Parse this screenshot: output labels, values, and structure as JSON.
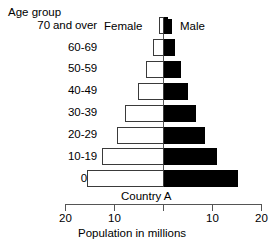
{
  "chart_data": {
    "type": "bar",
    "subtype": "population-pyramid",
    "title": "Country A",
    "xlabel": "Population in millions",
    "ylabel": "Age group",
    "categories": [
      "70 and over",
      "60-69",
      "50-59",
      "40-49",
      "30-39",
      "20-29",
      "10-19",
      "0-9"
    ],
    "series": [
      {
        "name": "Female",
        "side": "left",
        "color": "#ffffff",
        "values": [
          1.0,
          2.2,
          3.6,
          5.2,
          7.9,
          9.4,
          12.6,
          15.7
        ]
      },
      {
        "name": "Male",
        "side": "right",
        "color": "#000000",
        "values": [
          1.0,
          2.4,
          3.5,
          5.0,
          6.7,
          8.4,
          11.0,
          15.3
        ]
      }
    ],
    "xticks": [
      20,
      10,
      0,
      10,
      20
    ],
    "xtick_labels": [
      "20",
      "10",
      "",
      "10",
      "20"
    ],
    "xlim": [
      20,
      20
    ],
    "grid": false,
    "legend_position": "top-center",
    "annotations": []
  },
  "axes": {
    "age_axis_title": "Age group",
    "population_axis_title": "Population in millions",
    "age_groups": [
      {
        "label": "70 and over"
      },
      {
        "label": "60-69"
      },
      {
        "label": "50-59"
      },
      {
        "label": "40-49"
      },
      {
        "label": "30-39"
      },
      {
        "label": "20-29"
      },
      {
        "label": "10-19"
      },
      {
        "label": "0-9"
      }
    ],
    "population_ticks": [
      {
        "label": "20"
      },
      {
        "label": "10"
      },
      {
        "label": ""
      },
      {
        "label": "10"
      },
      {
        "label": "20"
      }
    ]
  },
  "legend": {
    "female_label": "Female",
    "male_label": "Male"
  },
  "caption": {
    "country": "Country A"
  },
  "colors": {
    "female_fill": "#ffffff",
    "female_stroke": "#3a3a3a",
    "male_fill": "#000000",
    "axis": "#555555",
    "text": "#000000",
    "background": "#ffffff"
  }
}
